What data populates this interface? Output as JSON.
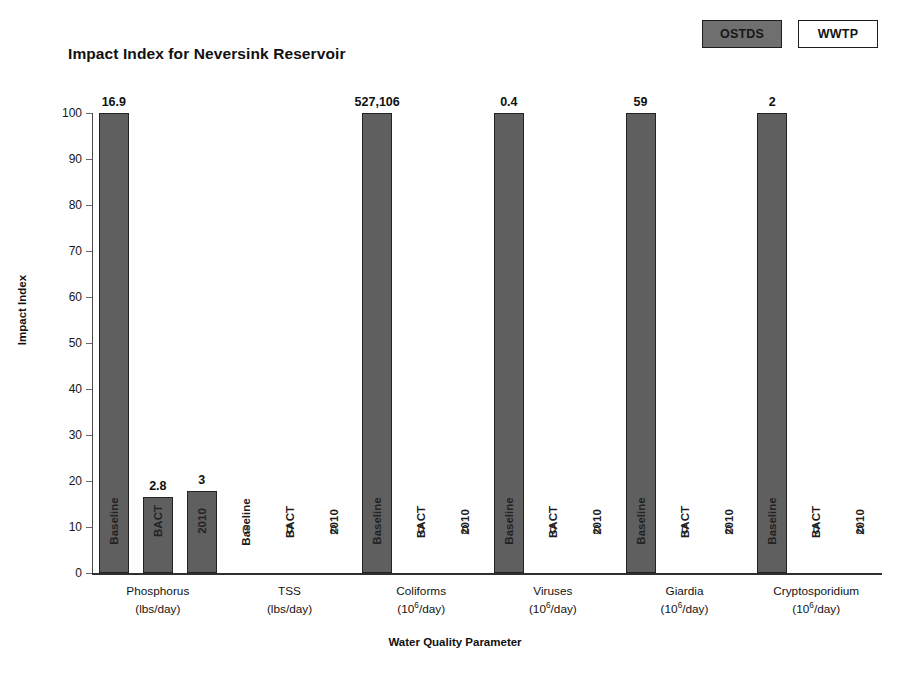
{
  "title": "Impact Index for Neversink Reservoir",
  "legend": {
    "items": [
      {
        "label": "OSTDS",
        "style": "filled",
        "color": "#6f6f6f"
      },
      {
        "label": "WWTP",
        "style": "hollow",
        "color": "#ffffff"
      }
    ]
  },
  "axes": {
    "y_title": "Impact Index",
    "x_title": "Water Quality Parameter",
    "y_ticks": [
      100,
      90,
      80,
      70,
      60,
      50,
      40,
      30,
      20,
      10,
      0
    ]
  },
  "chart_data": {
    "type": "bar",
    "title": "Impact Index for Neversink Reservoir",
    "xlabel": "Water Quality Parameter",
    "ylabel": "Impact Index",
    "ylim": [
      0,
      100
    ],
    "ytick_step": 10,
    "grid": false,
    "legend_position": "top-right",
    "legend_entries": [
      "OSTDS",
      "WWTP"
    ],
    "series_names": [
      "Baseline",
      "BACT",
      "2010"
    ],
    "categories": [
      {
        "name": "Phosphorus",
        "unit_base": "lbs",
        "unit": "(lbs/day)",
        "unit_exp": ""
      },
      {
        "name": "TSS",
        "unit_base": "lbs",
        "unit": "(lbs/day)",
        "unit_exp": ""
      },
      {
        "name": "Coliforms",
        "unit_base": "10",
        "unit": "(10^6/day)",
        "unit_exp": "6"
      },
      {
        "name": "Viruses",
        "unit_base": "10",
        "unit": "(10^6/day)",
        "unit_exp": "6"
      },
      {
        "name": "Giardia",
        "unit_base": "10",
        "unit": "(10^6/day)",
        "unit_exp": "6"
      },
      {
        "name": "Cryptosporidium",
        "unit_base": "10",
        "unit": "(10^6/day)",
        "unit_exp": "6"
      }
    ],
    "series": [
      {
        "name": "Baseline",
        "values": [
          100,
          0,
          100,
          100,
          100,
          100
        ]
      },
      {
        "name": "BACT",
        "values": [
          16.5,
          0,
          0,
          0,
          0,
          0
        ]
      },
      {
        "name": "2010",
        "values": [
          17.8,
          0,
          0,
          0,
          0,
          0
        ]
      }
    ],
    "data_labels": [
      {
        "category": "Phosphorus",
        "series": "Baseline",
        "text": "16.9"
      },
      {
        "category": "Phosphorus",
        "series": "BACT",
        "text": "2.8"
      },
      {
        "category": "Phosphorus",
        "series": "2010",
        "text": "3"
      },
      {
        "category": "TSS",
        "series": "Baseline",
        "text": "0"
      },
      {
        "category": "TSS",
        "series": "BACT",
        "text": "0"
      },
      {
        "category": "TSS",
        "series": "2010",
        "text": "0"
      },
      {
        "category": "Coliforms",
        "series": "Baseline",
        "text": "527,106"
      },
      {
        "category": "Coliforms",
        "series": "BACT",
        "text": "0"
      },
      {
        "category": "Coliforms",
        "series": "2010",
        "text": "0"
      },
      {
        "category": "Viruses",
        "series": "Baseline",
        "text": "0.4"
      },
      {
        "category": "Viruses",
        "series": "BACT",
        "text": "0"
      },
      {
        "category": "Viruses",
        "series": "2010",
        "text": "0"
      },
      {
        "category": "Giardia",
        "series": "Baseline",
        "text": "59"
      },
      {
        "category": "Giardia",
        "series": "BACT",
        "text": "0"
      },
      {
        "category": "Giardia",
        "series": "2010",
        "text": "0"
      },
      {
        "category": "Cryptosporidium",
        "series": "Baseline",
        "text": "2"
      },
      {
        "category": "Cryptosporidium",
        "series": "BACT",
        "text": "0"
      },
      {
        "category": "Cryptosporidium",
        "series": "2010",
        "text": "0"
      }
    ],
    "bar_color": "#5f5f5f",
    "bar_border_color": "#232323"
  }
}
